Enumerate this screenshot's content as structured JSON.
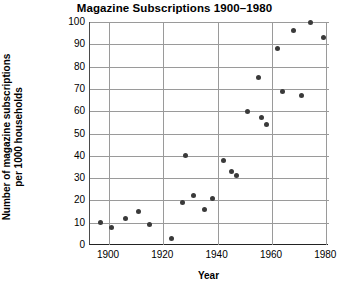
{
  "chart_data": {
    "type": "scatter",
    "title": "Magazine Subscriptions 1900–1980",
    "xlabel": "Year",
    "ylabel": "Number of magazine subscriptions per 1000 households",
    "ylabel_line1": "Number of magazine subscriptions",
    "ylabel_line2": "per 1000 households",
    "xlim": [
      1893,
      1981
    ],
    "ylim": [
      0,
      100
    ],
    "xticks": [
      1900,
      1920,
      1940,
      1960,
      1980
    ],
    "yticks": [
      0,
      10,
      20,
      30,
      40,
      50,
      60,
      70,
      80,
      90,
      100
    ],
    "grid": "both",
    "legend": "none",
    "marker_color": "#3a3a3a",
    "points": [
      {
        "x": 1897,
        "y": 10
      },
      {
        "x": 1901,
        "y": 8
      },
      {
        "x": 1906,
        "y": 12
      },
      {
        "x": 1911,
        "y": 15
      },
      {
        "x": 1915,
        "y": 9
      },
      {
        "x": 1923,
        "y": 3
      },
      {
        "x": 1927,
        "y": 19
      },
      {
        "x": 1931,
        "y": 22
      },
      {
        "x": 1935,
        "y": 16
      },
      {
        "x": 1938,
        "y": 21
      },
      {
        "x": 1928,
        "y": 40
      },
      {
        "x": 1942,
        "y": 38
      },
      {
        "x": 1945,
        "y": 33
      },
      {
        "x": 1947,
        "y": 31
      },
      {
        "x": 1951,
        "y": 60
      },
      {
        "x": 1955,
        "y": 75
      },
      {
        "x": 1956,
        "y": 57
      },
      {
        "x": 1958,
        "y": 54
      },
      {
        "x": 1962,
        "y": 88
      },
      {
        "x": 1964,
        "y": 69
      },
      {
        "x": 1968,
        "y": 96
      },
      {
        "x": 1971,
        "y": 67
      },
      {
        "x": 1974,
        "y": 100
      },
      {
        "x": 1979,
        "y": 93
      }
    ]
  }
}
